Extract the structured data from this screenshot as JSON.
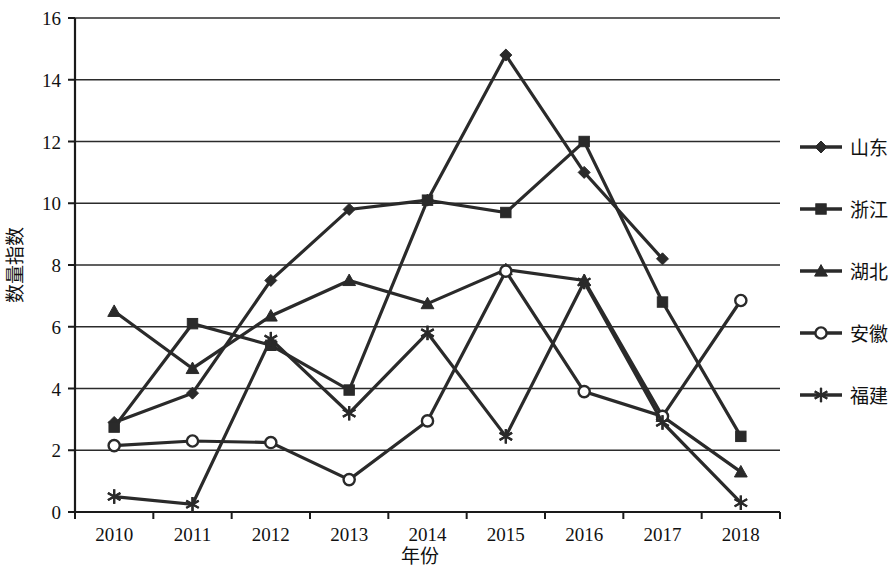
{
  "chart_data": {
    "type": "line",
    "title": "",
    "xlabel": "年份",
    "ylabel": "数量指数",
    "categories": [
      "2010",
      "2011",
      "2012",
      "2013",
      "2014",
      "2015",
      "2016",
      "2017",
      "2018"
    ],
    "x": [
      2010,
      2011,
      2012,
      2013,
      2014,
      2015,
      2016,
      2017,
      2018
    ],
    "ylim": [
      0,
      16
    ],
    "yticks": [
      0,
      2,
      4,
      6,
      8,
      10,
      12,
      14,
      16
    ],
    "ytick_labels": [
      "0",
      "2",
      "4",
      "6",
      "8",
      "10",
      "12",
      "14",
      "16"
    ],
    "grid": true,
    "legend_position": "right",
    "series": [
      {
        "name": "山东",
        "marker": "diamond",
        "color": "#2a2a2a",
        "values": [
          2.9,
          3.85,
          7.5,
          9.8,
          10.1,
          14.8,
          11.0,
          8.2,
          null
        ]
      },
      {
        "name": "浙江",
        "marker": "square",
        "color": "#2a2a2a",
        "values": [
          2.75,
          6.1,
          5.4,
          3.95,
          10.1,
          9.7,
          12.0,
          6.8,
          2.45
        ]
      },
      {
        "name": "湖北",
        "marker": "triangle",
        "color": "#2a2a2a",
        "values": [
          6.5,
          4.65,
          6.35,
          7.5,
          6.75,
          7.85,
          7.5,
          3.1,
          1.3
        ]
      },
      {
        "name": "安徽",
        "marker": "circle-open",
        "color": "#2a2a2a",
        "values": [
          2.15,
          2.3,
          2.25,
          1.05,
          2.95,
          7.8,
          3.9,
          3.1,
          6.85
        ]
      },
      {
        "name": "福建",
        "marker": "asterisk",
        "color": "#2a2a2a",
        "values": [
          0.5,
          0.25,
          5.6,
          3.2,
          5.8,
          2.45,
          7.45,
          2.9,
          0.3
        ]
      }
    ]
  },
  "legend": {
    "items": [
      {
        "label": "山东",
        "marker": "diamond"
      },
      {
        "label": "浙江",
        "marker": "square"
      },
      {
        "label": "湖北",
        "marker": "triangle"
      },
      {
        "label": "安徽",
        "marker": "circle-open"
      },
      {
        "label": "福建",
        "marker": "asterisk"
      }
    ]
  },
  "axes": {
    "y_title": "数量指数",
    "x_title": "年份"
  }
}
